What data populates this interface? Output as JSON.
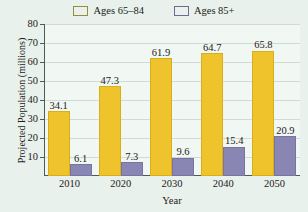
{
  "chart_data": {
    "type": "bar",
    "title": "",
    "xlabel": "Year",
    "ylabel": "Projected Population (millions)",
    "categories": [
      "2010",
      "2020",
      "2030",
      "2040",
      "2050"
    ],
    "series": [
      {
        "name": "Ages 65–84",
        "color": "#eec32b",
        "values": [
          34.1,
          47.3,
          61.9,
          64.7,
          65.8
        ]
      },
      {
        "name": "Ages 85+",
        "color": "#8a86b3",
        "values": [
          6.1,
          7.3,
          9.6,
          15.4,
          20.9
        ]
      }
    ],
    "ylim": [
      0,
      80
    ],
    "yticks": [
      10,
      20,
      30,
      40,
      50,
      60,
      70,
      80
    ],
    "ytick_labels": [
      "10",
      "20",
      "30",
      "40",
      "50",
      "60",
      "70",
      "80"
    ],
    "grid": true,
    "legend_position": "top-center",
    "data_labels": true,
    "background_color": "#e9f1ec",
    "plot_background_color": "#f1f7f3",
    "axis_color": "#4e5b54",
    "gridline_color": "#cfdcd5"
  },
  "legend": {
    "entries": [
      {
        "label": "Ages 65–84"
      },
      {
        "label": "Ages 85+"
      }
    ]
  },
  "axes": {
    "y_title": "Projected Population (millions)",
    "x_title": "Year"
  }
}
